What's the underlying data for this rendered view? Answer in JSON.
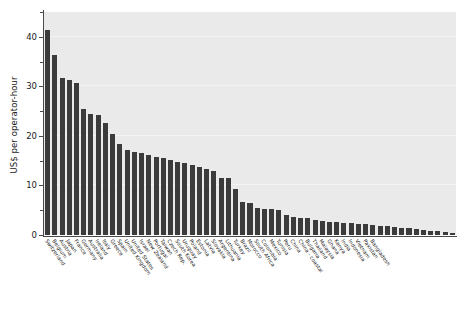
{
  "chart_data": {
    "type": "bar",
    "title": "",
    "xlabel": "",
    "ylabel": "US$ per operator-hour",
    "ylim": [
      0,
      45
    ],
    "yticks": [
      0,
      10,
      20,
      30,
      40
    ],
    "yticks_minor": [
      5,
      15,
      25,
      35
    ],
    "grid": false,
    "legend": "none",
    "bar_color": "#3b3b3b",
    "plot_background": "#eaeaea",
    "categories": [
      "Switzerland",
      "Belgium",
      "Austria",
      "Japan",
      "France",
      "Germany",
      "Australia",
      "Ireland",
      "Italy",
      "Greece",
      "Spain",
      "United Kingdom",
      "United States",
      "Israel",
      "New Zealand",
      "Portugal",
      "Taiwan",
      "Czech Rep.",
      "South Korea",
      "Uruguay",
      "Poland",
      "Estonia",
      "Latvia",
      "Slovakia",
      "Argentina",
      "Lithuania",
      "Turkey",
      "Brazil",
      "Morocco",
      "South Africa",
      "Colombia",
      "Mexico",
      "Tunisia",
      "Peru",
      "China",
      "Bulgaria",
      "Thailand",
      "Malaysia",
      "Ghana",
      "Kenya",
      "India",
      "Indonesia",
      "Vietnam",
      "Pakistan",
      "Bangladesh"
    ],
    "values": [
      41.3,
      36.3,
      31.7,
      31.3,
      30.7,
      25.5,
      24.5,
      24.2,
      22.7,
      20.3,
      18.3,
      17.2,
      16.8,
      16.5,
      16.2,
      15.8,
      15.5,
      15.2,
      14.8,
      14.5,
      14.2,
      13.8,
      13.4,
      12.9,
      11.6,
      11.5,
      9.2,
      6.6,
      6.4,
      5.4,
      5.3,
      5.2,
      5.0,
      4.1,
      3.6,
      3.4,
      3.1,
      2.9,
      2.7,
      2.6,
      2.5,
      2.4,
      2.3,
      2.2,
      2.1
    ],
    "extra_categories": [
      "China - coastal"
    ],
    "tail_values": [
      1.9,
      1.8,
      1.7,
      1.5,
      1.4,
      1.2,
      1.1,
      0.9,
      0.8,
      0.6,
      0.5
    ],
    "bar_count": 56
  }
}
